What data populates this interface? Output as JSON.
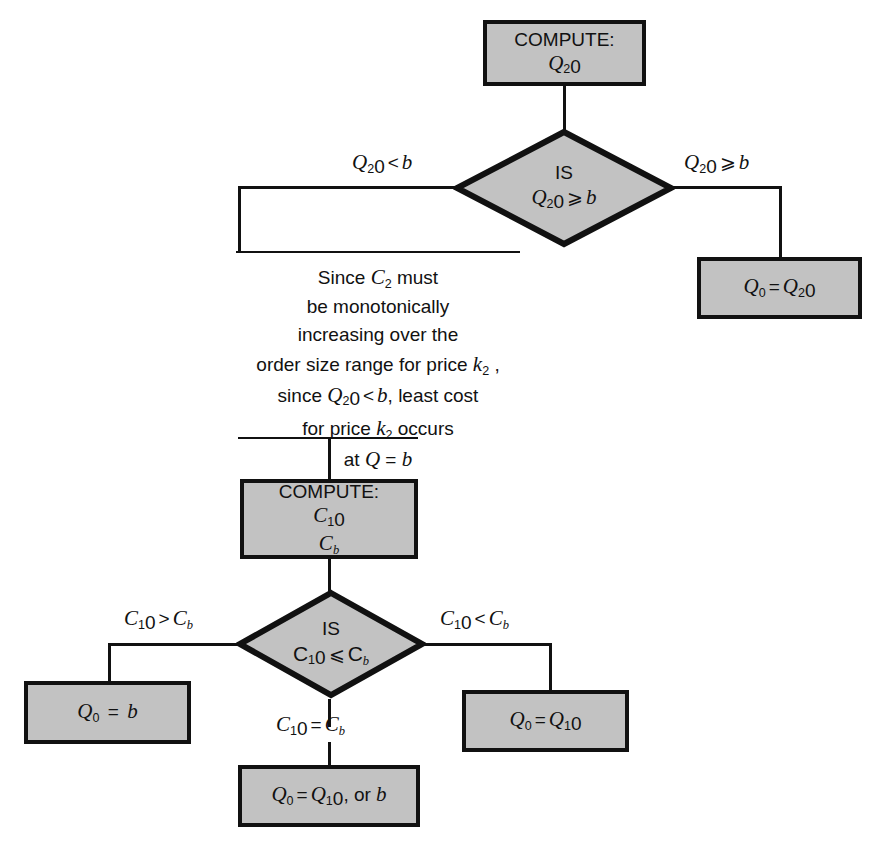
{
  "diagram": {
    "fill_color": "#c2c2c2",
    "stroke_color": "#111111"
  },
  "nodes": {
    "compute_q20": {
      "type": "process",
      "line1": "COMPUTE:",
      "line2": "Q20"
    },
    "decision_q20": {
      "type": "decision",
      "line1": "IS",
      "line2": "Q20 ⩾ b"
    },
    "result_q0_eq_q20": {
      "type": "process",
      "line1": "Q0 = Q20"
    },
    "compute_c10_cb": {
      "type": "process",
      "line1": "COMPUTE:",
      "line2": "C10",
      "line3": "Cb"
    },
    "decision_c10": {
      "type": "decision",
      "line1": "IS",
      "line2": "C10 ⩽ Cb"
    },
    "result_q0_eq_b": {
      "type": "process",
      "line1": "Q0 = b"
    },
    "result_q0_eq_q10": {
      "type": "process",
      "line1": "Q0 = Q10"
    },
    "result_q0_eq_q10_or_b": {
      "type": "process",
      "line1": "Q0 = Q10 , or b"
    }
  },
  "edge_labels": {
    "q20_less_b": "Q20 < b",
    "q20_ge_b": "Q20 ⩾ b",
    "c10_gt_cb": "C10 > Cb",
    "c10_lt_cb": "C10 < Cb",
    "c10_eq_cb": "C10 = Cb"
  },
  "annotation": {
    "line1": "Since C2 must",
    "line2": "be monotonically",
    "line3": "increasing over the",
    "line4": "order size range for price k2 ,",
    "line5": "since Q20 < b, least cost",
    "line6": "for price k2 occurs",
    "line7": "at Q = b"
  }
}
